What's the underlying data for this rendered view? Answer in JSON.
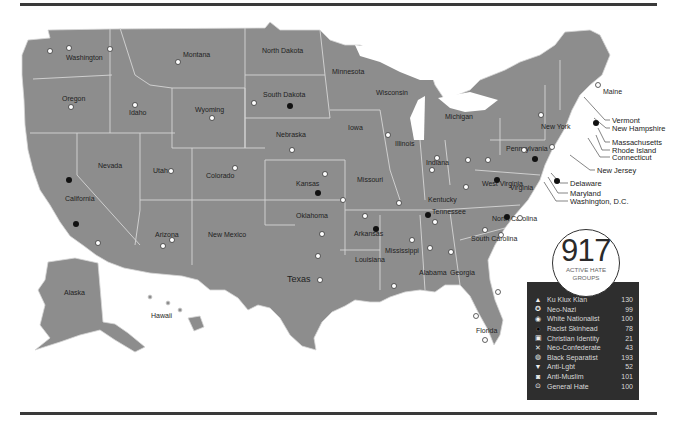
{
  "counter": {
    "total": "917",
    "caption_line1": "ACTIVE HATE",
    "caption_line2": "GROUPS"
  },
  "legend": {
    "items": [
      {
        "icon": "ku-klux-klan-icon",
        "glyph": "▲",
        "label": "Ku Klux Klan",
        "count": "130"
      },
      {
        "icon": "neo-nazi-icon",
        "glyph": "✪",
        "label": "Neo-Nazi",
        "count": "99"
      },
      {
        "icon": "white-nationalist-icon",
        "glyph": "◉",
        "label": "White Nationalist",
        "count": "100"
      },
      {
        "icon": "racist-skinhead-icon",
        "glyph": "●",
        "label": "Racist Skinhead",
        "count": "78"
      },
      {
        "icon": "christian-identity-icon",
        "glyph": "▣",
        "label": "Christian Identity",
        "count": "21"
      },
      {
        "icon": "neo-confederate-icon",
        "glyph": "✕",
        "label": "Neo-Confederate",
        "count": "43"
      },
      {
        "icon": "black-separatist-icon",
        "glyph": "◍",
        "label": "Black Separatist",
        "count": "193"
      },
      {
        "icon": "anti-lgbt-icon",
        "glyph": "▼",
        "label": "Anti-Lgbt",
        "count": "52"
      },
      {
        "icon": "anti-muslim-icon",
        "glyph": "◙",
        "label": "Anti-Muslim",
        "count": "101"
      },
      {
        "icon": "general-hate-icon",
        "glyph": "⊙",
        "label": "General Hate",
        "count": "100"
      }
    ]
  },
  "states": {
    "washington": "Washington",
    "oregon": "Oregon",
    "california": "California",
    "nevada": "Nevada",
    "idaho": "Idaho",
    "montana": "Montana",
    "wyoming": "Wyoming",
    "utah": "Utah",
    "colorado": "Colorado",
    "arizona": "Arizona",
    "new_mexico": "New Mexico",
    "north_dakota": "North Dakota",
    "south_dakota": "South Dakota",
    "nebraska": "Nebraska",
    "kansas": "Kansas",
    "oklahoma": "Oklahoma",
    "texas": "Texas",
    "minnesota": "Minnesota",
    "iowa": "Iowa",
    "missouri": "Missouri",
    "arkansas": "Arkansas",
    "louisiana": "Louisiana",
    "wisconsin": "Wisconsin",
    "illinois": "Illinois",
    "michigan": "Michigan",
    "indiana": "Indiana",
    "ohio": "Ohio",
    "kentucky": "Kentucky",
    "tennessee": "Tennessee",
    "mississippi": "Mississippi",
    "alabama": "Alabama",
    "georgia": "Georgia",
    "florida": "Florida",
    "south_carolina": "South Carolina",
    "north_carolina": "North Carolina",
    "virginia": "Virginia",
    "west_virginia": "West Virginia",
    "pennsylvania": "Pennsylvania",
    "new_york": "New York",
    "maine": "Maine",
    "alaska": "Alaska",
    "hawaii": "Hawaii"
  },
  "callouts": {
    "vermont": "Vermont",
    "new_hampshire": "New Hampshire",
    "massachusetts": "Massachusetts",
    "rhode_island": "Rhode Island",
    "connecticut": "Connecticut",
    "new_jersey": "New Jersey",
    "delaware": "Delaware",
    "maryland": "Maryland",
    "washington_dc": "Washington, D.C."
  }
}
